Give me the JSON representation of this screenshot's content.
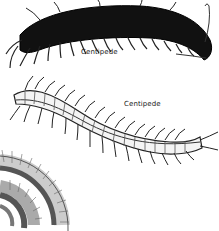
{
  "image": {
    "description": "Black-and-white illustration of centipedes",
    "colors": {
      "background": "#ffffff",
      "ink": "#111111",
      "label": "#222222"
    }
  },
  "labels": [
    {
      "text": "Centipede"
    },
    {
      "text": "Centipede"
    }
  ],
  "figures": [
    {
      "name": "dark-centipede",
      "style": "solid black body with pale legs"
    },
    {
      "name": "light-centipede",
      "style": "segmented pale body with dark outline"
    },
    {
      "name": "coiled-millipede",
      "style": "coiled spiral with many fine legs"
    }
  ]
}
